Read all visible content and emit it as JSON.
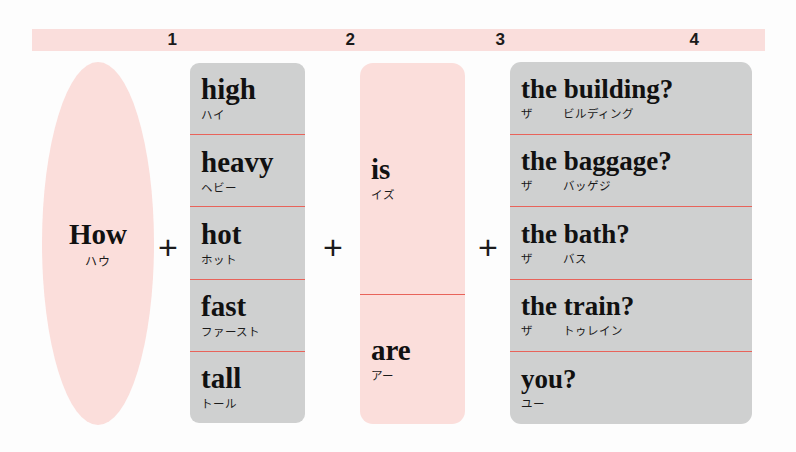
{
  "header": {
    "numbers": [
      "1",
      "2",
      "3",
      "4"
    ],
    "bar_color": "#fadedc"
  },
  "colors": {
    "pink": "#fbdedb",
    "grey": "#cfd0d0",
    "divider_red": "#e8635a",
    "text": "#111111"
  },
  "operators": {
    "plus_1": "+",
    "plus_2": "+",
    "plus_3": "+"
  },
  "columns": [
    {
      "index": "1",
      "shape": "ellipse",
      "color": "pink",
      "items": [
        {
          "english": "How",
          "kana": "ハウ"
        }
      ]
    },
    {
      "index": "2",
      "shape": "rounded-rect",
      "color": "grey",
      "items": [
        {
          "english": "high",
          "kana": "ハイ"
        },
        {
          "english": "heavy",
          "kana": "ヘビー"
        },
        {
          "english": "hot",
          "kana": "ホット"
        },
        {
          "english": "fast",
          "kana": "ファースト"
        },
        {
          "english": "tall",
          "kana": "トール"
        }
      ]
    },
    {
      "index": "3",
      "shape": "rounded-rect",
      "color": "pink",
      "items": [
        {
          "english": "is",
          "kana": "イズ"
        },
        {
          "english": "are",
          "kana": "アー"
        }
      ]
    },
    {
      "index": "4",
      "shape": "rounded-rect",
      "color": "grey",
      "items": [
        {
          "english": "the building?",
          "kana_article": "ザ",
          "kana_noun": "ビルディング"
        },
        {
          "english": "the baggage?",
          "kana_article": "ザ",
          "kana_noun": "バッゲジ"
        },
        {
          "english": "the bath?",
          "kana_article": "ザ",
          "kana_noun": "バス"
        },
        {
          "english": "the train?",
          "kana_article": "ザ",
          "kana_noun": "トゥレイン"
        },
        {
          "english": "you?",
          "kana_article": "ユー",
          "kana_noun": ""
        }
      ]
    }
  ]
}
